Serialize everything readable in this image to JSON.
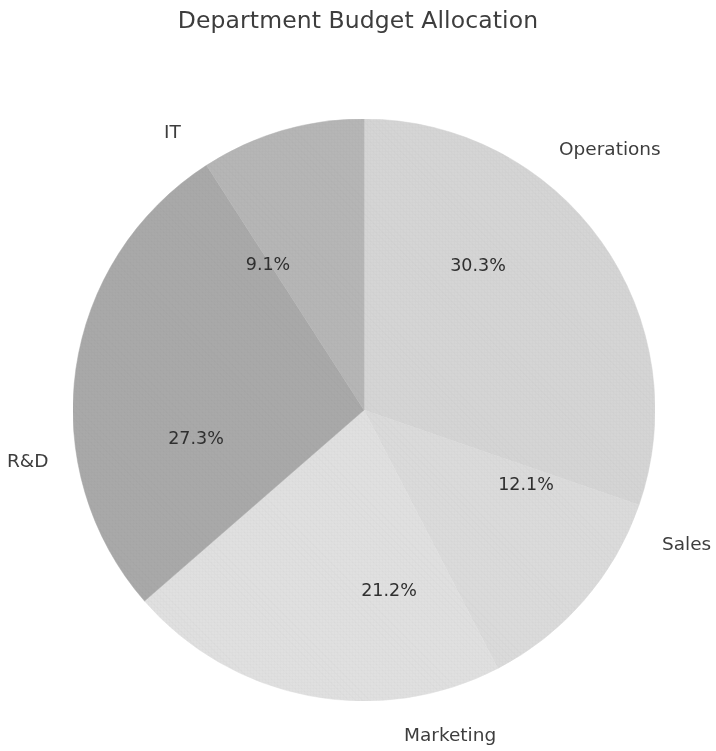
{
  "chart_data": {
    "type": "pie",
    "title": "Department Budget Allocation",
    "categories": [
      "Operations",
      "Sales",
      "Marketing",
      "R&D",
      "IT"
    ],
    "values": [
      30.3,
      12.1,
      21.2,
      27.3,
      9.1
    ],
    "value_labels": [
      "30.3%",
      "12.1%",
      "21.2%",
      "27.3%",
      "9.1%"
    ],
    "colors": [
      "#d5d5d5",
      "#dbdbdb",
      "#e0e0e0",
      "#a9a9a9",
      "#b6b6b6"
    ],
    "startangle": 90,
    "direction": "clockwise",
    "autopct": "%.1f%%",
    "legend": "none",
    "grid": false,
    "slices": [
      {
        "label": "Operations",
        "value": 30.3,
        "pct_text": "30.3%",
        "color": "#d5d5d5"
      },
      {
        "label": "Sales",
        "value": 12.1,
        "pct_text": "12.1%",
        "color": "#dbdbdb"
      },
      {
        "label": "Marketing",
        "value": 21.2,
        "pct_text": "21.2%",
        "color": "#e0e0e0"
      },
      {
        "label": "R&D",
        "value": 27.3,
        "pct_text": "27.3%",
        "color": "#a9a9a9"
      },
      {
        "label": "IT",
        "value": 9.1,
        "pct_text": "9.1%",
        "color": "#b6b6b6"
      }
    ]
  },
  "background": {
    "ghost_line_1": "Conclusion Remarks"
  }
}
